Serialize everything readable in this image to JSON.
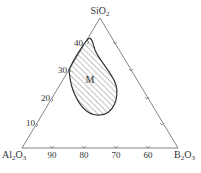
{
  "diagram": {
    "type": "ternary",
    "vertices": {
      "top": {
        "label": "SiO",
        "sub": "2"
      },
      "left": {
        "label": "Al",
        "sub1": "2",
        "mid": "O",
        "sub2": "3"
      },
      "right": {
        "label": "B",
        "sub1": "2",
        "mid": "O",
        "sub2": "3"
      }
    },
    "left_axis_ticks": [
      "10",
      "20",
      "30",
      "40"
    ],
    "bottom_axis_ticks": [
      "90",
      "80",
      "70",
      "60"
    ],
    "region": {
      "label": "M",
      "fill": "hatched"
    },
    "colors": {
      "line": "#555555",
      "region_border": "#333333",
      "hatch": "#555555"
    }
  }
}
